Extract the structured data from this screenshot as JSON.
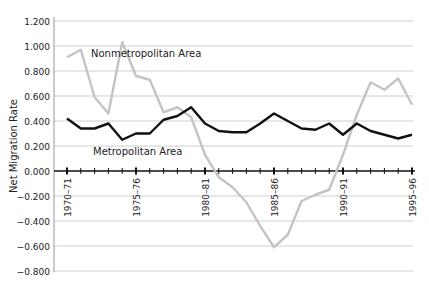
{
  "chart_data": {
    "type": "line",
    "title": "",
    "xlabel": "",
    "ylabel": "Net Migration Rate",
    "ylim": [
      -0.8,
      1.2
    ],
    "yticks": [
      "1.200",
      "1.000",
      "0.800",
      "0.600",
      "0.400",
      "0.200",
      "0.000",
      "−0.200",
      "−0.400",
      "−0.600",
      "−0.800"
    ],
    "ytick_values": [
      1.2,
      1.0,
      0.8,
      0.6,
      0.4,
      0.2,
      0.0,
      -0.2,
      -0.4,
      -0.6,
      -0.8
    ],
    "grid": true,
    "x": [
      "1970–71",
      "1971–72",
      "1972–73",
      "1973–74",
      "1974–75",
      "1975–76",
      "1976–77",
      "1977–78",
      "1978–79",
      "1979–80",
      "1980–81",
      "1981–82",
      "1982–83",
      "1983–84",
      "1984–85",
      "1985–86",
      "1986–87",
      "1987–88",
      "1988–89",
      "1989–90",
      "1990–91",
      "1991–92",
      "1992–93",
      "1993–94",
      "1994–95",
      "1995–96"
    ],
    "xtick_labels": [
      "1970–71",
      "1975–76",
      "1980–81",
      "1985–86",
      "1990–91",
      "1995–96"
    ],
    "series": [
      {
        "name": "Nonmetropolitan Area",
        "color": "#c4c4c4",
        "values": [
          0.91,
          0.97,
          0.59,
          0.46,
          1.03,
          0.76,
          0.73,
          0.47,
          0.51,
          0.43,
          0.13,
          -0.05,
          -0.13,
          -0.25,
          -0.44,
          -0.61,
          -0.51,
          -0.24,
          -0.19,
          -0.15,
          0.13,
          0.45,
          0.71,
          0.65,
          0.74,
          0.53
        ]
      },
      {
        "name": "Metropolitan Area",
        "color": "#111111",
        "values": [
          0.42,
          0.34,
          0.34,
          0.38,
          0.25,
          0.3,
          0.3,
          0.41,
          0.44,
          0.51,
          0.38,
          0.32,
          0.31,
          0.31,
          0.38,
          0.46,
          0.4,
          0.34,
          0.33,
          0.38,
          0.29,
          0.38,
          0.32,
          0.29,
          0.26,
          0.29
        ]
      }
    ],
    "annotations": [
      {
        "text": "Nonmetropolitan Area",
        "series": 0
      },
      {
        "text": "Metropolitan Area",
        "series": 1
      }
    ],
    "legend_position": "inline"
  }
}
